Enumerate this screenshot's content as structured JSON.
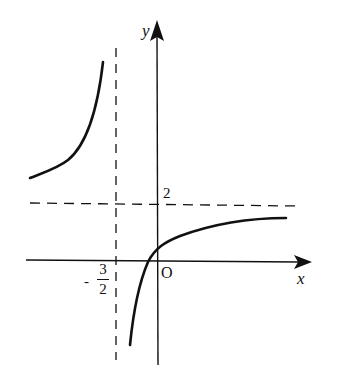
{
  "figure": {
    "axes": {
      "x_label": "x",
      "y_label": "y",
      "origin_label": "O"
    },
    "asymptotes": {
      "vertical": {
        "x": -1.5,
        "label_sign": "-",
        "label_num": "3",
        "label_den": "2"
      },
      "horizontal": {
        "y": 2,
        "label": "2"
      }
    },
    "branches": [
      {
        "name": "upper-left",
        "description": "left of x=-3/2, above y=2, rising toward the vertical asymptote"
      },
      {
        "name": "lower-right",
        "description": "right of x=-3/2, below y=2, passing near the origin and approaching y=2"
      }
    ],
    "colors": {
      "stroke": "#111111",
      "background": "#ffffff"
    }
  }
}
